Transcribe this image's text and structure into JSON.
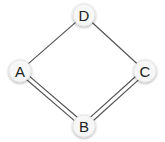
{
  "diagram": {
    "type": "graph",
    "nodes": [
      {
        "id": "D",
        "label": "D",
        "x": 84,
        "y": 15
      },
      {
        "id": "A",
        "label": "A",
        "x": 20,
        "y": 71
      },
      {
        "id": "C",
        "label": "C",
        "x": 145,
        "y": 71
      },
      {
        "id": "B",
        "label": "B",
        "x": 84,
        "y": 126
      }
    ],
    "edges": [
      {
        "from": "A",
        "to": "D",
        "order": 1
      },
      {
        "from": "D",
        "to": "C",
        "order": 1
      },
      {
        "from": "A",
        "to": "B",
        "order": 2
      },
      {
        "from": "B",
        "to": "C",
        "order": 2
      }
    ],
    "colors": {
      "edge": "#555555",
      "node_fill": "#f7f7f7",
      "node_text": "#222222"
    }
  }
}
